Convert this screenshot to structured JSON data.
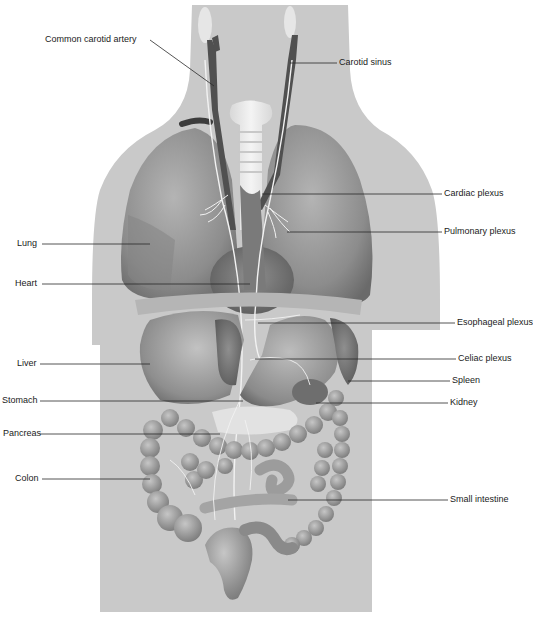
{
  "figure": {
    "colors": {
      "background": "#ffffff",
      "body_silhouette": "#c9c9c9",
      "organ_mid": "#9a9a9a",
      "organ_dark": "#6e6e6e",
      "vessel_dark": "#4a4a4a",
      "nerve": "#f2f2f2",
      "leader_line": "#2a2a2a",
      "label_text": "#1a1a1a"
    }
  },
  "labels": {
    "left": [
      {
        "id": "common-carotid-artery",
        "text": "Common carotid artery"
      },
      {
        "id": "lung",
        "text": "Lung"
      },
      {
        "id": "heart",
        "text": "Heart"
      },
      {
        "id": "liver",
        "text": "Liver"
      },
      {
        "id": "stomach",
        "text": "Stomach"
      },
      {
        "id": "pancreas",
        "text": "Pancreas"
      },
      {
        "id": "colon",
        "text": "Colon"
      }
    ],
    "right": [
      {
        "id": "carotid-sinus",
        "text": "Carotid sinus"
      },
      {
        "id": "cardiac-plexus",
        "text": "Cardiac plexus"
      },
      {
        "id": "pulmonary-plexus",
        "text": "Pulmonary plexus"
      },
      {
        "id": "esophageal-plexus",
        "text": "Esophageal plexus"
      },
      {
        "id": "celiac-plexus",
        "text": "Celiac plexus"
      },
      {
        "id": "spleen",
        "text": "Spleen"
      },
      {
        "id": "kidney",
        "text": "Kidney"
      },
      {
        "id": "small-intestine",
        "text": "Small intestine"
      }
    ]
  }
}
